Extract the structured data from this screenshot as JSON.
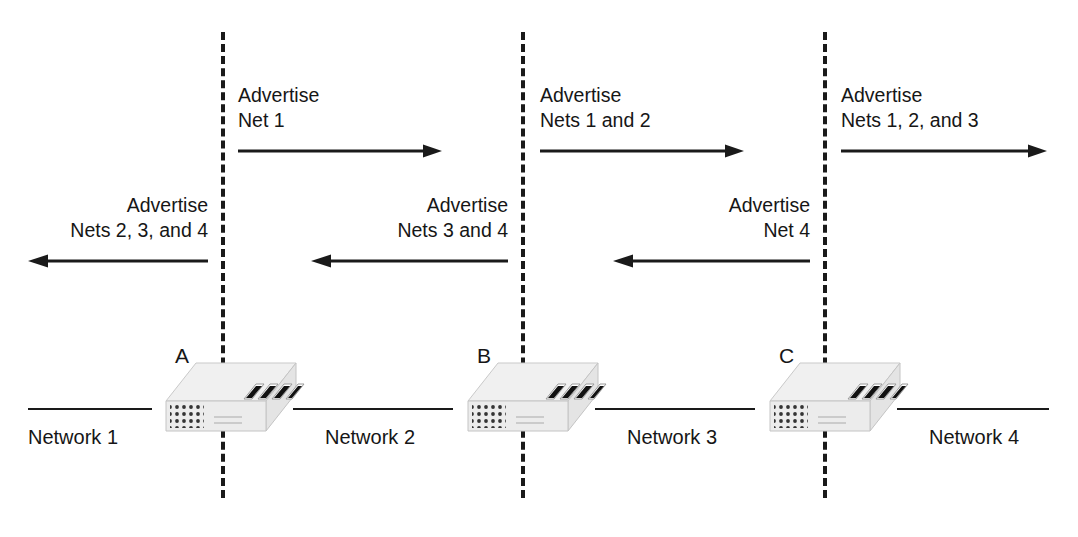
{
  "diagram": {
    "colors": {
      "line": "#1a1a1a",
      "text": "#161616",
      "device_body": "#f2f2f2",
      "device_top": "#ededed",
      "device_side": "#dcdcdc",
      "background": "#ffffff"
    }
  },
  "boundaries": [
    {
      "name": "boundary-1"
    },
    {
      "name": "boundary-2"
    },
    {
      "name": "boundary-3"
    }
  ],
  "networks": [
    {
      "label": "Network 1"
    },
    {
      "label": "Network 2"
    },
    {
      "label": "Network 3"
    },
    {
      "label": "Network 4"
    }
  ],
  "routers": [
    {
      "letter": "A",
      "ports": 4
    },
    {
      "letter": "B",
      "ports": 4
    },
    {
      "letter": "C",
      "ports": 4
    }
  ],
  "advertisements": {
    "rightward": [
      {
        "line1": "Advertise",
        "line2": "Net 1",
        "direction": "right",
        "arrow_icon": "arrow-right-icon"
      },
      {
        "line1": "Advertise",
        "line2": "Nets 1 and 2",
        "direction": "right",
        "arrow_icon": "arrow-right-icon"
      },
      {
        "line1": "Advertise",
        "line2": "Nets 1, 2, and 3",
        "direction": "right",
        "arrow_icon": "arrow-right-icon"
      }
    ],
    "leftward": [
      {
        "line1": "Advertise",
        "line2": "Nets 2, 3, and 4",
        "direction": "left",
        "arrow_icon": "arrow-left-icon"
      },
      {
        "line1": "Advertise",
        "line2": "Nets 3 and 4",
        "direction": "left",
        "arrow_icon": "arrow-left-icon"
      },
      {
        "line1": "Advertise",
        "line2": "Net 4",
        "direction": "left",
        "arrow_icon": "arrow-left-icon"
      }
    ]
  }
}
